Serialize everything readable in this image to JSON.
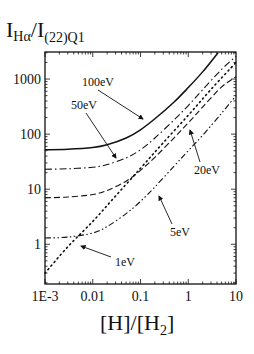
{
  "chart_data": {
    "type": "line",
    "title": "",
    "ylabel": {
      "main": "I",
      "sub1": "Hα",
      "slash": "/I",
      "sub2": "(22)Q1"
    },
    "xlabel": {
      "pre": "[H]/[H",
      "sub": "2",
      "post": "]"
    },
    "xscale": "log",
    "yscale": "log",
    "xlim": [
      0.001,
      10
    ],
    "ylim": [
      0.19,
      3100
    ],
    "grid": false,
    "x_ticks": [
      {
        "value": 0.001,
        "label": "1E-3"
      },
      {
        "value": 0.01,
        "label": "0.01"
      },
      {
        "value": 0.1,
        "label": "0.1"
      },
      {
        "value": 1,
        "label": "1"
      },
      {
        "value": 10,
        "label": "10"
      }
    ],
    "y_ticks": [
      {
        "value": 1,
        "label": "1"
      },
      {
        "value": 10,
        "label": "10"
      },
      {
        "value": 100,
        "label": "100"
      },
      {
        "value": 1000,
        "label": "1000"
      }
    ],
    "series": [
      {
        "name": "100eV",
        "style": "solid",
        "x": [
          0.001,
          0.003,
          0.01,
          0.02,
          0.05,
          0.1,
          0.2,
          0.5,
          1,
          2,
          4.2
        ],
        "y": [
          52,
          53,
          57,
          64,
          85,
          120,
          190,
          380,
          700,
          1350,
          3000
        ]
      },
      {
        "name": "50eV",
        "style": "dashdot",
        "x": [
          0.001,
          0.003,
          0.01,
          0.02,
          0.05,
          0.1,
          0.2,
          0.5,
          1,
          2,
          5,
          10
        ],
        "y": [
          23,
          23.5,
          25,
          28,
          37,
          52,
          85,
          180,
          330,
          640,
          1500,
          2600
        ]
      },
      {
        "name": "20eV",
        "style": "dashed",
        "x": [
          0.001,
          0.003,
          0.01,
          0.02,
          0.05,
          0.1,
          0.2,
          0.5,
          1,
          2,
          5,
          10
        ],
        "y": [
          7,
          7.2,
          8,
          9.5,
          14,
          22,
          38,
          85,
          160,
          310,
          720,
          1100
        ]
      },
      {
        "name": "5eV",
        "style": "dashdotdot",
        "x": [
          0.001,
          0.003,
          0.01,
          0.02,
          0.05,
          0.1,
          0.2,
          0.5,
          1,
          2,
          5,
          10
        ],
        "y": [
          1.3,
          1.35,
          1.6,
          2.1,
          3.6,
          6,
          11,
          26,
          50,
          95,
          240,
          500
        ]
      },
      {
        "name": "1eV",
        "style": "dotted",
        "x": [
          0.001,
          0.003,
          0.01,
          0.03,
          0.1,
          0.3,
          1,
          3,
          10
        ],
        "y": [
          0.3,
          0.9,
          2.6,
          7.5,
          24,
          70,
          220,
          650,
          2000
        ]
      }
    ],
    "annotations": [
      {
        "label": "100eV",
        "tx": 82,
        "ty": 86,
        "ax1": 98,
        "ay1": 90,
        "ax2": 143,
        "ay2": 119
      },
      {
        "label": "50eV",
        "tx": 71,
        "ty": 109,
        "ax1": 86,
        "ay1": 113,
        "ax2": 116,
        "ay2": 158
      },
      {
        "label": "20eV",
        "tx": 194,
        "ty": 174,
        "ax1": 200,
        "ay1": 162,
        "ax2": 190,
        "ay2": 130
      },
      {
        "label": "5eV",
        "tx": 170,
        "ty": 236,
        "ax1": 172,
        "ay1": 224,
        "ax2": 159,
        "ay2": 196
      },
      {
        "label": "1eV",
        "tx": 115,
        "ty": 266,
        "ax1": 111,
        "ay1": 257,
        "ax2": 81,
        "ay2": 246
      }
    ]
  }
}
